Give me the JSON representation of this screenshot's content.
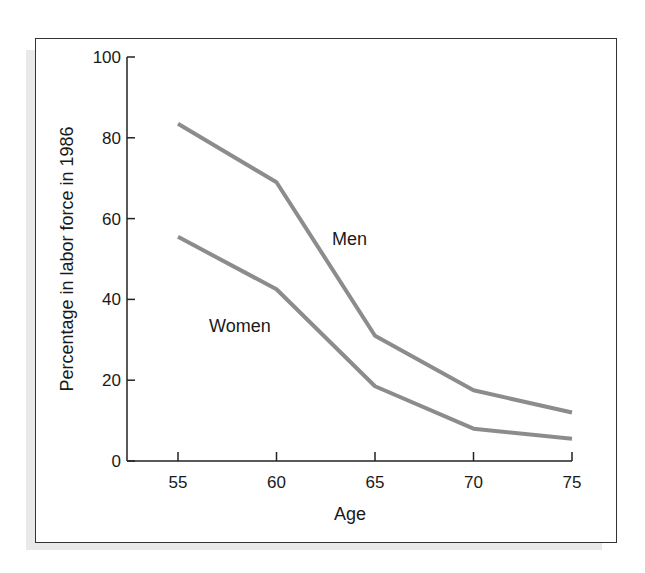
{
  "chart_data": {
    "type": "line",
    "title": "",
    "xlabel": "Age",
    "ylabel": "Percentage in labor force in 1986",
    "x": [
      55,
      60,
      65,
      70,
      75
    ],
    "xticks": [
      "55",
      "60",
      "65",
      "70",
      "75"
    ],
    "yticks": [
      "0",
      "20",
      "40",
      "60",
      "80",
      "100"
    ],
    "ylim": [
      0,
      100
    ],
    "xlim": [
      55,
      75
    ],
    "grid": false,
    "legend": "inline labels",
    "series": [
      {
        "name": "Men",
        "values": [
          83.5,
          69,
          31,
          17.5,
          12
        ],
        "color": "#8c8c8c"
      },
      {
        "name": "Women",
        "values": [
          55.5,
          42.5,
          18.5,
          8,
          5.5
        ],
        "color": "#8c8c8c"
      }
    ]
  },
  "labels": {
    "men": "Men",
    "women": "Women",
    "xlabel": "Age",
    "ylabel": "Percentage in labor force in 1986"
  }
}
